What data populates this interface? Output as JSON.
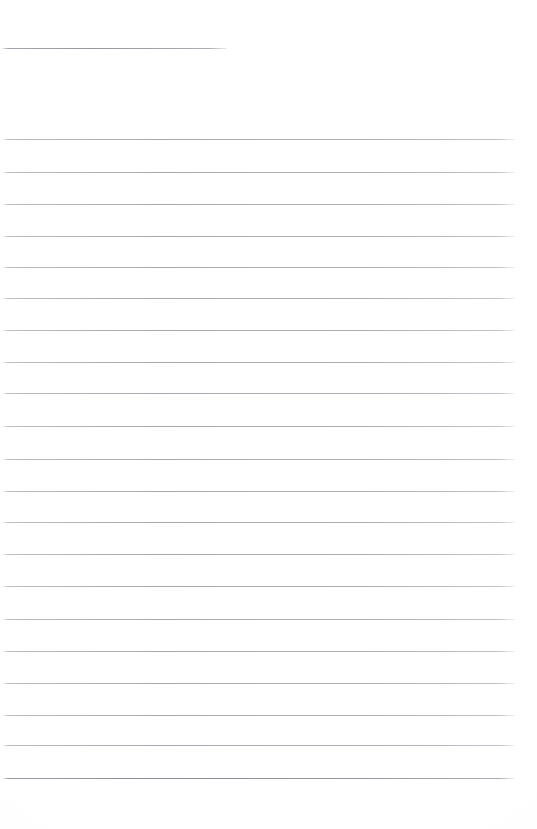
{
  "page": {
    "kind": "blank-ruled-page",
    "width": 537,
    "height": 829,
    "background_color": "#ffffff",
    "title_text": "",
    "body_text": "",
    "visible_text_count": 0
  },
  "ink": {
    "rule_color": "#aeaeb6",
    "rule_color_emphasis": "#8e8e98",
    "rule_thickness_px": 1
  },
  "header_rule": {
    "name": "header-rule",
    "x": 2,
    "y": 48,
    "width": 225,
    "label": ""
  },
  "ruled_lines": {
    "count": 20,
    "left_x": 3,
    "right_x": 515,
    "width": 512,
    "spacing_px": 32.3,
    "first_y": 139,
    "last_y": 778,
    "y_positions": [
      139,
      172,
      204,
      236,
      267,
      298,
      330,
      362,
      393,
      426,
      459,
      491,
      522,
      554,
      586,
      619,
      651,
      683,
      715,
      745
    ],
    "emphasis_y": 778
  },
  "write_slots": {
    "count": 20,
    "values": [
      "",
      "",
      "",
      "",
      "",
      "",
      "",
      "",
      "",
      "",
      "",
      "",
      "",
      "",
      "",
      "",
      "",
      "",
      "",
      ""
    ],
    "placeholder": ""
  }
}
